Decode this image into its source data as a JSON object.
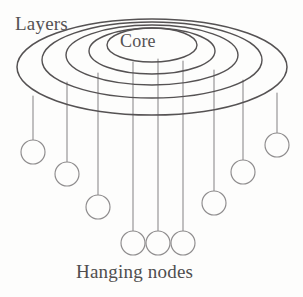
{
  "figure": {
    "title_label": "Layers",
    "center_label": "Core",
    "bottom_label": "Hanging nodes",
    "background_color": "#fdfdfc",
    "line_color": "#555253",
    "node_stroke_color": "#8e8c8d",
    "stem_color": "#8e8c8d"
  },
  "chart_data": {
    "type": "diagram",
    "title": "Layers",
    "annotations": [
      "Layers",
      "Core",
      "Hanging nodes"
    ],
    "layers": [
      {
        "name": "layer-1-outer",
        "cx": 152,
        "cy": 67,
        "rx": 135,
        "ry": 48
      },
      {
        "name": "layer-2",
        "cx": 152,
        "cy": 60,
        "rx": 110,
        "ry": 38
      },
      {
        "name": "layer-3",
        "cx": 152,
        "cy": 55,
        "rx": 86,
        "ry": 30
      },
      {
        "name": "layer-4",
        "cx": 152,
        "cy": 51,
        "rx": 63,
        "ry": 23
      },
      {
        "name": "layer-5-core",
        "cx": 152,
        "cy": 45,
        "rx": 45,
        "ry": 17
      }
    ],
    "layer_count": 5,
    "node_count": 9,
    "nodes": [
      {
        "id": 1,
        "stem_x": 33,
        "stem_top": 96,
        "circle_cy": 152,
        "r": 12
      },
      {
        "id": 2,
        "stem_x": 67,
        "stem_top": 82,
        "circle_cy": 174,
        "r": 12
      },
      {
        "id": 3,
        "stem_x": 98,
        "stem_top": 73,
        "circle_cy": 207,
        "r": 12
      },
      {
        "id": 4,
        "stem_x": 133,
        "stem_top": 62,
        "circle_cy": 243,
        "r": 12
      },
      {
        "id": 5,
        "stem_x": 158,
        "stem_top": 59,
        "circle_cy": 243,
        "r": 12
      },
      {
        "id": 6,
        "stem_x": 183,
        "stem_top": 61,
        "circle_cy": 243,
        "r": 12
      },
      {
        "id": 7,
        "stem_x": 214,
        "stem_top": 70,
        "circle_cy": 203,
        "r": 12
      },
      {
        "id": 8,
        "stem_x": 243,
        "stem_top": 80,
        "circle_cy": 172,
        "r": 12
      },
      {
        "id": 9,
        "stem_x": 277,
        "stem_top": 93,
        "circle_cy": 145,
        "r": 12
      }
    ]
  }
}
